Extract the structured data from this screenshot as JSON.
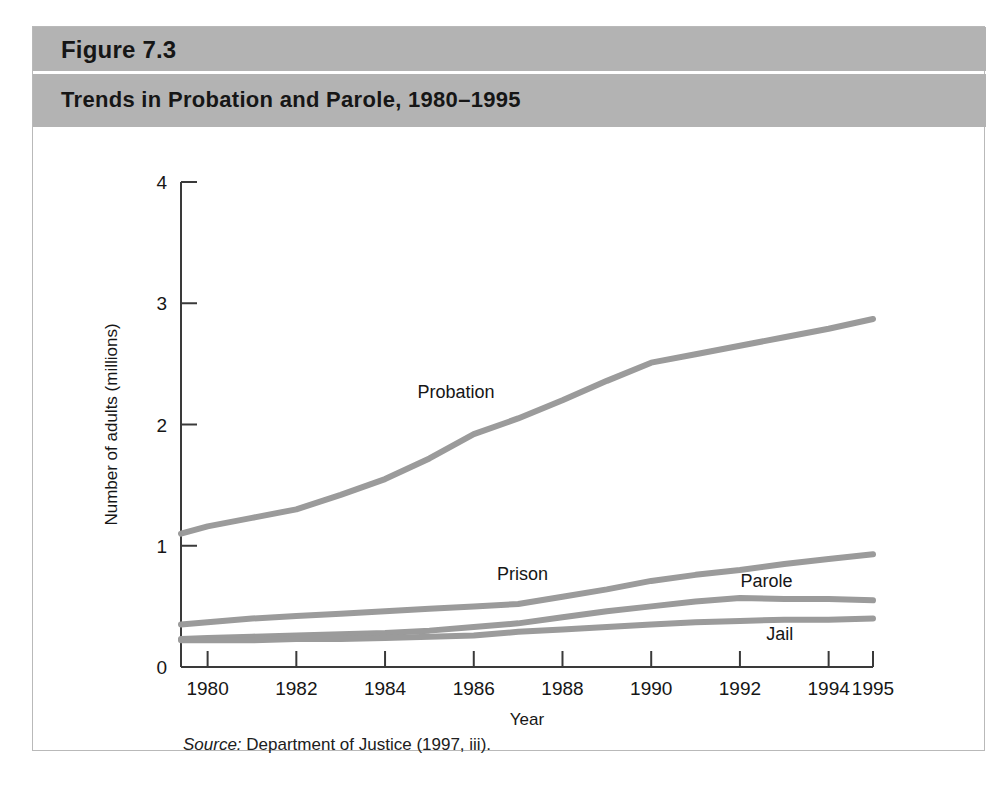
{
  "figure": {
    "number": "Figure 7.3",
    "title": "Trends in Probation and Parole, 1980–1995",
    "source_prefix": "Source:",
    "source_text": " Department of Justice (1997, iii).",
    "band_color": "#b3b3b3",
    "line_color": "#9b9b9b",
    "axis_color": "#3a3a3a"
  },
  "chart_data": {
    "type": "line",
    "title": "Trends in Probation and Parole, 1980–1995",
    "xlabel": "Year",
    "ylabel": "Number of adults (millions)",
    "xlim": [
      1979.4,
      1995.0
    ],
    "ylim": [
      0,
      4
    ],
    "grid": false,
    "legend": "inline-labels",
    "xticks": [
      1980,
      1982,
      1984,
      1986,
      1988,
      1990,
      1992,
      1994,
      1995
    ],
    "xtick_labels": [
      "1980",
      "1982",
      "1984",
      "1986",
      "1988",
      "1990",
      "1992",
      "1994",
      "1995"
    ],
    "yticks": [
      0,
      1,
      2,
      3,
      4
    ],
    "ytick_labels": [
      "0",
      "1",
      "2",
      "3",
      "4"
    ],
    "x": [
      1979.4,
      1980,
      1981,
      1982,
      1983,
      1984,
      1985,
      1986,
      1987,
      1988,
      1989,
      1990,
      1991,
      1992,
      1993,
      1994,
      1995
    ],
    "series": [
      {
        "name": "Probation",
        "label": "Probation",
        "label_x": 1985.6,
        "label_y": 2.22,
        "values": [
          1.1,
          1.16,
          1.23,
          1.3,
          1.42,
          1.55,
          1.72,
          1.92,
          2.05,
          2.2,
          2.36,
          2.51,
          2.58,
          2.65,
          2.72,
          2.79,
          2.87
        ]
      },
      {
        "name": "Prison",
        "label": "Prison",
        "label_x": 1987.1,
        "label_y": 0.72,
        "values": [
          0.35,
          0.37,
          0.4,
          0.42,
          0.44,
          0.46,
          0.48,
          0.5,
          0.52,
          0.58,
          0.64,
          0.71,
          0.76,
          0.8,
          0.85,
          0.89,
          0.93
        ]
      },
      {
        "name": "Parole",
        "label": "Parole",
        "label_x": 1992.6,
        "label_y": 0.66,
        "values": [
          0.23,
          0.24,
          0.25,
          0.26,
          0.27,
          0.28,
          0.3,
          0.33,
          0.36,
          0.41,
          0.46,
          0.5,
          0.54,
          0.57,
          0.56,
          0.56,
          0.55
        ]
      },
      {
        "name": "Jail",
        "label": "Jail",
        "label_x": 1992.9,
        "label_y": 0.22,
        "values": [
          0.22,
          0.22,
          0.22,
          0.23,
          0.23,
          0.24,
          0.25,
          0.26,
          0.29,
          0.31,
          0.33,
          0.35,
          0.37,
          0.38,
          0.39,
          0.39,
          0.4
        ]
      }
    ]
  }
}
